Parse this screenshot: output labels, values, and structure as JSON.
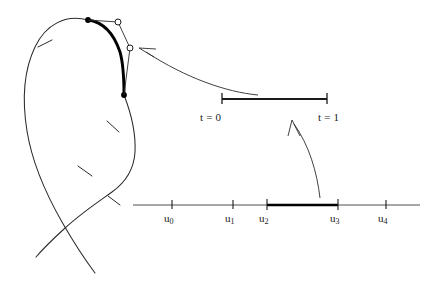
{
  "figure": {
    "background_color": "#ffffff",
    "stroke_color": "#1a1a1a",
    "highlight_color": "#000000"
  },
  "parameter_bar": {
    "start_label": "t = 0",
    "end_label": "t = 1",
    "x_start": 222,
    "x_end": 327,
    "y": 99
  },
  "knot_line": {
    "x_start": 133,
    "x_end": 420,
    "y": 205,
    "highlight_from": "u2",
    "highlight_to": "u3",
    "knots": [
      {
        "id": "u0",
        "base": "u",
        "sub": "0",
        "x": 172
      },
      {
        "id": "u1",
        "base": "u",
        "sub": "1",
        "x": 233
      },
      {
        "id": "u2",
        "base": "u",
        "sub": "2",
        "x": 267
      },
      {
        "id": "u3",
        "base": "u",
        "sub": "3",
        "x": 338
      },
      {
        "id": "u4",
        "base": "u",
        "sub": "4",
        "x": 386
      }
    ]
  },
  "spline": {
    "segment_endpoints": [
      {
        "name": "segment-start-dot",
        "x": 88,
        "y": 20
      },
      {
        "name": "segment-end-dot",
        "x": 124,
        "y": 95
      }
    ],
    "control_points": [
      {
        "name": "control-point-1",
        "x": 118,
        "y": 22
      },
      {
        "name": "control-point-2",
        "x": 130,
        "y": 48
      }
    ],
    "curve_ticks": 4
  },
  "annotations": {
    "arrow_to_curve": "leader arrow from parameter bar to curve segment",
    "arrow_to_bar": "leader arrow from knot interval to parameter bar"
  }
}
